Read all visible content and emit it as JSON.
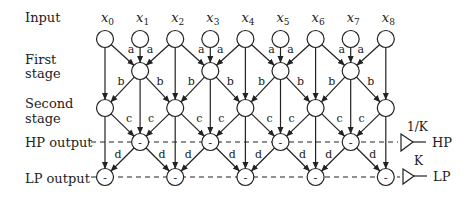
{
  "row_labels": {
    "input": "Input",
    "first_stage": [
      "First",
      "stage"
    ],
    "second_stage": [
      "Second",
      "stage"
    ],
    "hp_output": "HP output",
    "lp_output": "LP output"
  },
  "inputs": [
    {
      "base": "x",
      "sub": "0"
    },
    {
      "base": "x",
      "sub": "1"
    },
    {
      "base": "x",
      "sub": "2"
    },
    {
      "base": "x",
      "sub": "3"
    },
    {
      "base": "x",
      "sub": "4"
    },
    {
      "base": "x",
      "sub": "5"
    },
    {
      "base": "x",
      "sub": "6"
    },
    {
      "base": "x",
      "sub": "7"
    },
    {
      "base": "x",
      "sub": "8"
    }
  ],
  "coefficients": {
    "first_stage": "a",
    "second_stage": "b",
    "hp_stage": "c",
    "lp_stage": "d"
  },
  "node_sign": "-",
  "gains": {
    "hp": {
      "gain": "1/K",
      "label": "HP"
    },
    "lp": {
      "gain": "K",
      "label": "LP"
    }
  },
  "layout": {
    "x0": 105,
    "dx": 35.1,
    "r": 8.5,
    "rows": {
      "input": 39,
      "first": 71,
      "second": 108,
      "hp": 142,
      "lp": 177
    }
  }
}
